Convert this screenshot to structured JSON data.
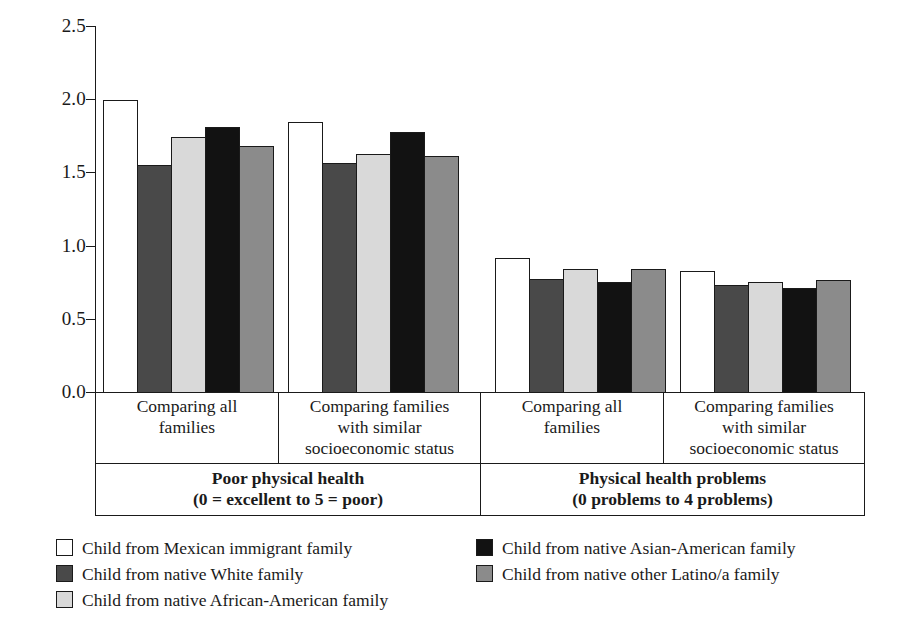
{
  "chart_data": {
    "type": "bar",
    "title": "",
    "xlabel": "",
    "ylabel": "",
    "ylim": [
      0.0,
      2.5
    ],
    "yticks": [
      "0.0",
      "0.5",
      "1.0",
      "1.5",
      "2.0",
      "2.5"
    ],
    "ytick_values": [
      0.0,
      0.5,
      1.0,
      1.5,
      2.0,
      2.5
    ],
    "grid": false,
    "legend_position": "bottom",
    "categories": [
      "Comparing all families",
      "Comparing families with similar socioeconomic status",
      "Comparing all families",
      "Comparing families with similar socioeconomic status"
    ],
    "panels": [
      {
        "title": "Poor physical health",
        "subtitle": "(0 = excellent to 5 = poor)",
        "groups": [
          {
            "label_lines": [
              "Comparing all",
              "families"
            ]
          },
          {
            "label_lines": [
              "Comparing families",
              "with similar",
              "socioeconomic status"
            ]
          }
        ]
      },
      {
        "title": "Physical health problems",
        "subtitle": "(0 problems to 4 problems)",
        "groups": [
          {
            "label_lines": [
              "Comparing all",
              "families"
            ]
          },
          {
            "label_lines": [
              "Comparing families",
              "with similar",
              "socioeconomic status"
            ]
          }
        ]
      }
    ],
    "series": [
      {
        "name": "Child from Mexican immigrant family",
        "color": "#ffffff",
        "swatch": "white",
        "values": [
          2.0,
          1.85,
          0.92,
          0.83
        ]
      },
      {
        "name": "Child from native White family",
        "color": "#494949",
        "swatch": "dark",
        "values": [
          1.56,
          1.57,
          0.78,
          0.74
        ]
      },
      {
        "name": "Child from native African-American family",
        "color": "#d9d9d9",
        "swatch": "light",
        "values": [
          1.75,
          1.63,
          0.85,
          0.76
        ]
      },
      {
        "name": "Child from native Asian-American family",
        "color": "#121212",
        "swatch": "black",
        "values": [
          1.82,
          1.78,
          0.76,
          0.72
        ]
      },
      {
        "name": "Child from native other Latino/a family",
        "color": "#8b8b8b",
        "swatch": "medium",
        "values": [
          1.69,
          1.62,
          0.85,
          0.77
        ]
      }
    ]
  },
  "axis": {
    "ytick_labels": [
      "2.5",
      "2.0",
      "1.5",
      "1.0",
      "0.5",
      "0.0"
    ]
  },
  "legend": {
    "left_column": [
      {
        "label": "Child from Mexican immigrant family",
        "swatch": "white"
      },
      {
        "label": "Child from native White family",
        "swatch": "dark"
      },
      {
        "label": "Child from native African-American family",
        "swatch": "light"
      }
    ],
    "right_column": [
      {
        "label": "Child from native Asian-American family",
        "swatch": "black"
      },
      {
        "label": "Child from native other Latino/a family",
        "swatch": "medium"
      }
    ]
  }
}
